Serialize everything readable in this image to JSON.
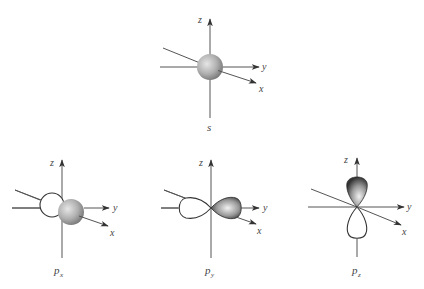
{
  "figure": {
    "panels": [
      {
        "id": "s",
        "caption": "s",
        "subscript": "",
        "axes": {
          "x": "x",
          "y": "y",
          "z": "z"
        }
      },
      {
        "id": "px",
        "caption": "p",
        "subscript": "x",
        "axes": {
          "x": "x",
          "y": "y",
          "z": "z"
        }
      },
      {
        "id": "py",
        "caption": "p",
        "subscript": "y",
        "axes": {
          "x": "x",
          "y": "y",
          "z": "z"
        }
      },
      {
        "id": "pz",
        "caption": "p",
        "subscript": "z",
        "axes": {
          "x": "x",
          "y": "y",
          "z": "z"
        }
      }
    ],
    "colors": {
      "axis": "#555555",
      "shaded_lobe_dark": "#444444",
      "shaded_lobe_light": "#e8e8e8",
      "sphere_light": "#dcdcdc",
      "sphere_dark": "#808080",
      "outline_lobe": "#333333"
    }
  }
}
